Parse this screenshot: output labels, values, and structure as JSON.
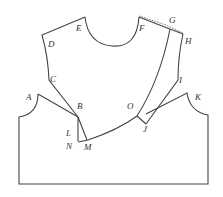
{
  "diagram": {
    "type": "sewing-pattern-draft",
    "stroke_color": "#444444",
    "background": "#ffffff",
    "points": [
      {
        "id": "A",
        "label": "A",
        "x": 31,
        "y": 99
      },
      {
        "id": "B",
        "label": "B",
        "x": 81,
        "y": 106
      },
      {
        "id": "C",
        "label": "C",
        "x": 55,
        "y": 82
      },
      {
        "id": "D",
        "label": "D",
        "x": 51,
        "y": 46
      },
      {
        "id": "E",
        "label": "E",
        "x": 79,
        "y": 32
      },
      {
        "id": "F",
        "label": "F",
        "x": 169,
        "y": 28
      },
      {
        "id": "G",
        "label": "G",
        "x": 173,
        "y": 22
      },
      {
        "id": "H",
        "label": "H",
        "x": 188,
        "y": 44
      },
      {
        "id": "I",
        "label": "I",
        "x": 179,
        "y": 82
      },
      {
        "id": "J",
        "label": "J",
        "x": 143,
        "y": 131
      },
      {
        "id": "K",
        "label": "K",
        "x": 195,
        "y": 100
      },
      {
        "id": "L",
        "label": "L",
        "x": 68,
        "y": 136
      },
      {
        "id": "M",
        "label": "M",
        "x": 87,
        "y": 150
      },
      {
        "id": "N",
        "label": "N",
        "x": 67,
        "y": 147
      },
      {
        "id": "O",
        "label": "O",
        "x": 129,
        "y": 107
      }
    ]
  }
}
